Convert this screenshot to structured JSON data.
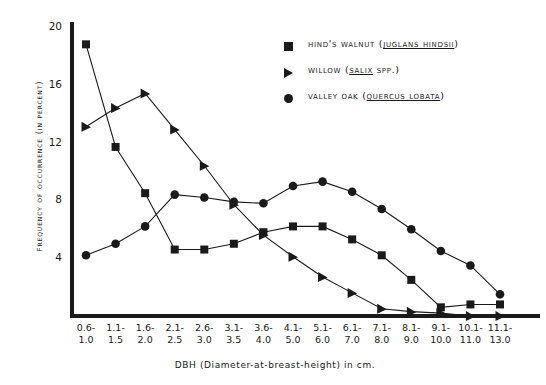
{
  "chart_data": {
    "type": "line",
    "title": "",
    "xlabel": "DBH (Diameter-at-breast-height) in cm.",
    "ylabel": "Frequency of occurrence (in percent)",
    "categories": [
      "0.6-\n1.0",
      "1.1-\n1.5",
      "1.6-\n2.0",
      "2.1-\n2.5",
      "2.6-\n3.0",
      "3.1-\n3.5",
      "3.6-\n4.0",
      "4.1-\n5.0",
      "5.1-\n6.0",
      "6.1-\n7.0",
      "7.1-\n8.0",
      "8.1-\n9.0",
      "9.1-\n10.0",
      "10.1-\n11.0",
      "11.1-\n13.0"
    ],
    "ylim": [
      0,
      20
    ],
    "yticks": [
      4,
      8,
      12,
      16,
      20
    ],
    "ytick_labels": [
      "4",
      "8",
      "12",
      "16",
      "20"
    ],
    "grid": false,
    "legend_position": "top-right",
    "series": [
      {
        "name": "Hind's walnut (Juglans Hindsii)",
        "common_name": "Hind's walnut",
        "scientific_name": "Juglans Hindsii",
        "marker": "square",
        "values": [
          18.8,
          11.7,
          8.5,
          4.6,
          4.6,
          5.0,
          5.8,
          6.2,
          6.2,
          5.3,
          4.2,
          2.5,
          0.6,
          0.8,
          0.8
        ]
      },
      {
        "name": "Willow (Salix spp.)",
        "common_name": "Willow",
        "scientific_name": "Salix spp.",
        "marker": "triangle",
        "values": [
          13.1,
          14.4,
          15.4,
          12.9,
          10.4,
          7.7,
          5.6,
          4.1,
          2.7,
          1.6,
          0.5,
          0.3,
          0.2,
          0.0,
          0.0
        ]
      },
      {
        "name": "Valley oak (Quercus lobata)",
        "common_name": "Valley oak",
        "scientific_name": "Quercus lobata",
        "marker": "circle",
        "values": [
          4.2,
          5.0,
          6.2,
          8.4,
          8.2,
          7.9,
          7.8,
          9.0,
          9.3,
          8.6,
          7.4,
          6.0,
          4.5,
          3.5,
          1.5
        ]
      }
    ]
  },
  "legend": {
    "items": [
      {
        "marker": "square",
        "prefix": "Hind's walnut (",
        "scientific": "Juglans Hindsii",
        "suffix": ")"
      },
      {
        "marker": "triangle",
        "prefix": "Willow (",
        "scientific": "Salix",
        "suffix": " spp.)"
      },
      {
        "marker": "circle",
        "prefix": "Valley oak (",
        "scientific": "Quercus lobata",
        "suffix": ")"
      }
    ]
  },
  "axes": {
    "y_title": "Frequency of occurrence (in percent)",
    "x_title": "DBH (Diameter-at-breast-height) in cm."
  }
}
